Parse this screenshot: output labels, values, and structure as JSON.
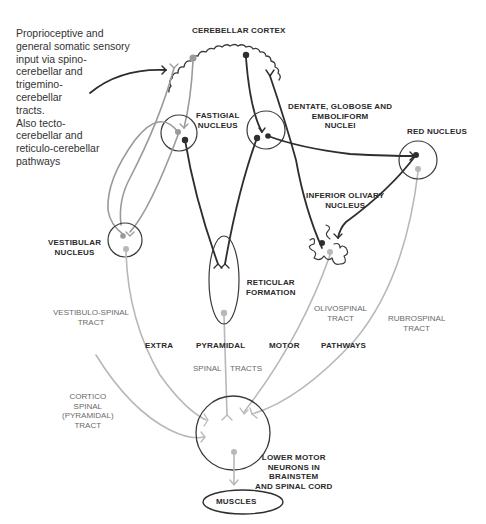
{
  "colors": {
    "dark_fiber": "#2e2e2e",
    "gray_fiber": "#9a9a9a",
    "light_fiber": "#b8b8b8",
    "outline": "#3a3a3a",
    "text": "#2a2a2a",
    "tract_text": "#6a6a6a"
  },
  "input_text": {
    "lines": [
      "Proprioceptive and",
      "general somatic sensory",
      "input via spino-",
      "cerebellar and",
      "trigemino-",
      "cerebellar",
      "tracts.",
      "Also tecto-",
      "cerebellar and",
      "reticulo-cerebellar",
      "pathways"
    ]
  },
  "structures": {
    "cerebellar_cortex": "CEREBELLAR CORTEX",
    "fastigial_nucleus": [
      "FASTIGIAL",
      "NUCLEUS"
    ],
    "dentate_nuclei": [
      "DENTATE, GLOBOSE AND",
      "EMBOLIFORM",
      "NUCLEI"
    ],
    "red_nucleus": "RED NUCLEUS",
    "inferior_olivary": [
      "INFERIOR OLIVARY",
      "NUCLEUS"
    ],
    "vestibular_nucleus": [
      "VESTIBULAR",
      "NUCLEUS"
    ],
    "reticular_formation": [
      "RETICULAR",
      "FORMATION"
    ],
    "lower_motor_neurons": [
      "LOWER MOTOR",
      "NEURONS IN",
      "BRAINSTEM",
      "AND SPINAL CORD"
    ],
    "muscles": "MUSCLES"
  },
  "tracts": {
    "vestibulo_spinal": [
      "VESTIBULO-SPINAL",
      "TRACT"
    ],
    "olivospinal": [
      "OLIVOSPINAL",
      "TRACT"
    ],
    "rubrospinal": [
      "RUBROSPINAL",
      "TRACT"
    ],
    "cortico_spinal": [
      "CORTICO",
      "SPINAL",
      "(PYRAMIDAL)",
      "TRACT"
    ]
  },
  "pathway_words": {
    "extra": "EXTRA",
    "pyramidal": "PYRAMIDAL",
    "motor": "MOTOR",
    "pathways": "PATHWAYS",
    "spinal": "SPINAL",
    "tracts": "TRACTS"
  }
}
